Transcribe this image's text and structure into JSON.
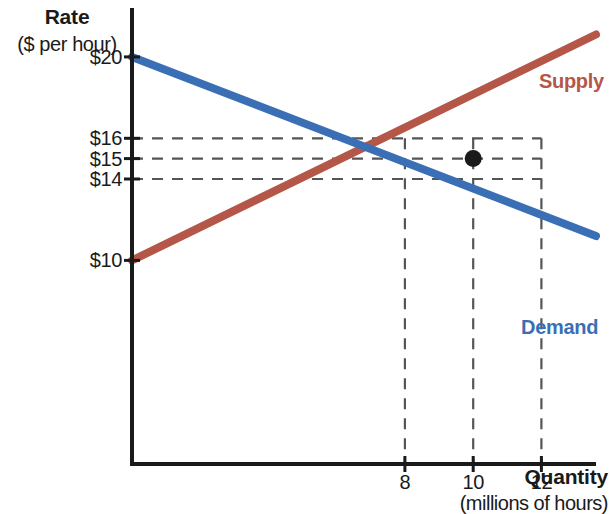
{
  "chart_data": {
    "type": "line",
    "title": "",
    "xlabel": "Quantity",
    "xlabel_units": "(millions of hours)",
    "ylabel": "Rate",
    "ylabel_units": "($ per hour)",
    "xlim": [
      0,
      13.6
    ],
    "ylim": [
      0,
      22.4
    ],
    "grid": "dashed-guides-only",
    "legend": "inline-endpoint-labels",
    "x_ticks": [
      8,
      10,
      12
    ],
    "x_tick_labels": [
      "8",
      "10",
      "12"
    ],
    "y_ticks": [
      10,
      14,
      15,
      16,
      20
    ],
    "y_tick_labels": [
      "$10",
      "$14",
      "$15",
      "$16",
      "$20"
    ],
    "series": [
      {
        "name": "Demand",
        "color": "#3b6fb5",
        "x": [
          0,
          13.6
        ],
        "values": [
          20,
          11.2
        ]
      },
      {
        "name": "Supply",
        "color": "#b55748",
        "x": [
          0,
          13.6
        ],
        "values": [
          10,
          21.1
        ]
      }
    ],
    "annotations": [
      {
        "name": "equilibrium-point",
        "x": 10,
        "y": 15,
        "marker": "filled-circle",
        "color": "#1a1a1a"
      }
    ],
    "guide_lines": {
      "horizontal": [
        16,
        15,
        14
      ],
      "vertical": [
        8,
        10,
        12
      ]
    },
    "readings": [
      {
        "quantity": 8,
        "demand_rate": 16,
        "supply_rate": 14
      },
      {
        "quantity": 10,
        "demand_rate": 15,
        "supply_rate": 15
      },
      {
        "quantity": 12,
        "demand_rate": 14,
        "supply_rate": 16
      }
    ]
  },
  "axes": {
    "y_title_line1": "Rate",
    "y_title_line2": "($ per hour)",
    "x_title_line1": "Quantity",
    "x_title_line2": "(millions of hours)",
    "y_tick_20": "$20",
    "y_tick_16": "$16",
    "y_tick_15": "$15",
    "y_tick_14": "$14",
    "y_tick_10": "$10",
    "x_tick_8": "8",
    "x_tick_10": "10",
    "x_tick_12": "12"
  },
  "series_labels": {
    "supply": "Supply",
    "demand": "Demand"
  },
  "colors": {
    "supply": "#b55748",
    "demand": "#3b6fb5",
    "axis": "#1a1a1a",
    "guide": "#555555",
    "background": "#ffffff"
  }
}
